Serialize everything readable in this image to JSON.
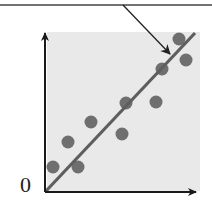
{
  "figure": {
    "kind": "scatter-with-regression-line",
    "origin_label": "0",
    "colors": {
      "panel_bg": "#e9e9e9",
      "axis": "#1a1a1a",
      "dot": "#6f6f6f",
      "regression_line": "#5e5e5e",
      "callout": "#222222",
      "top_rule": "#444444"
    }
  },
  "chart_data": {
    "type": "scatter",
    "title": "",
    "xlabel": "",
    "ylabel": "",
    "origin_label": "0",
    "grid": false,
    "legend": null,
    "points_px": [
      {
        "x": 53,
        "y": 167
      },
      {
        "x": 78,
        "y": 167
      },
      {
        "x": 68,
        "y": 142
      },
      {
        "x": 91,
        "y": 122
      },
      {
        "x": 122,
        "y": 134
      },
      {
        "x": 126,
        "y": 103
      },
      {
        "x": 156,
        "y": 102
      },
      {
        "x": 162,
        "y": 69
      },
      {
        "x": 179,
        "y": 39
      },
      {
        "x": 186,
        "y": 60
      }
    ],
    "points_normalized": [
      {
        "x": 0.05,
        "y": 0.15
      },
      {
        "x": 0.21,
        "y": 0.15
      },
      {
        "x": 0.15,
        "y": 0.31
      },
      {
        "x": 0.3,
        "y": 0.44
      },
      {
        "x": 0.5,
        "y": 0.36
      },
      {
        "x": 0.53,
        "y": 0.56
      },
      {
        "x": 0.73,
        "y": 0.57
      },
      {
        "x": 0.77,
        "y": 0.78
      },
      {
        "x": 0.88,
        "y": 0.97
      },
      {
        "x": 0.93,
        "y": 0.84
      }
    ],
    "trend_line": {
      "from": {
        "x": 0,
        "y": 0
      },
      "to": {
        "x": 1.0,
        "y": 1.0
      }
    },
    "annotation": {
      "type": "callout-arrow",
      "target": "trend_line",
      "text": ""
    }
  }
}
